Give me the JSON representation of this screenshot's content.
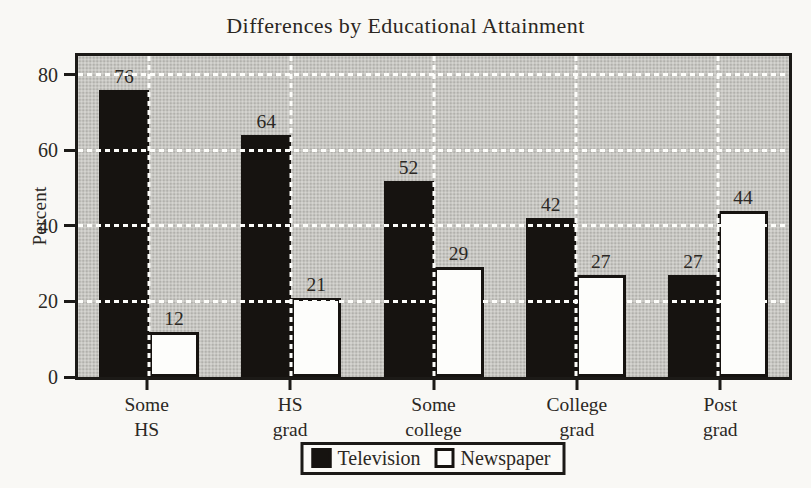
{
  "page": {
    "background": "#f9f8f5"
  },
  "chart_data": {
    "type": "bar",
    "title": "Differences by Educational Attainment",
    "xlabel": "",
    "ylabel": "Percent",
    "categories": [
      "Some\nHS",
      "HS\ngrad",
      "Some\ncollege",
      "College\ngrad",
      "Post\ngrad"
    ],
    "series": [
      {
        "name": "Television",
        "color": "#161310",
        "values": [
          76,
          64,
          52,
          42,
          27
        ]
      },
      {
        "name": "Newspaper",
        "color": "#fdfdfb",
        "values": [
          12,
          21,
          29,
          27,
          44
        ]
      }
    ],
    "y_ticks": [
      0,
      20,
      40,
      60,
      80
    ],
    "ylim": [
      0,
      85
    ],
    "grid": {
      "horizontal_lines_at": [
        20,
        40,
        60,
        80
      ],
      "vertical_lines_at": "category-centers",
      "line_style": "white-dashed"
    },
    "plot_background": "#d6d5d1",
    "legend_position": "bottom-center",
    "bar_value_labels_shown": true
  }
}
